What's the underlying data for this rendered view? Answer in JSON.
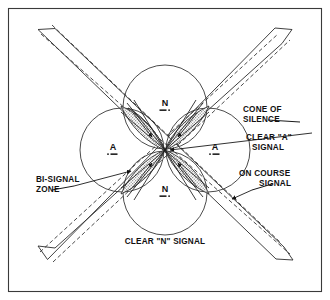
{
  "figure": {
    "frame_color": "#3a3a3a",
    "line_color": "#2b2b2b",
    "shade_color": "#8c8c8c",
    "background": "#ffffff"
  },
  "sectors": [
    {
      "id": "north",
      "letter": "N",
      "morse": "-.",
      "x": 165,
      "y": 106
    },
    {
      "id": "west",
      "letter": "A",
      "morse": ".-",
      "x": 113,
      "y": 150
    },
    {
      "id": "east",
      "letter": "A",
      "morse": ".-",
      "x": 215,
      "y": 150
    },
    {
      "id": "south",
      "letter": "N",
      "morse": "-.",
      "x": 165,
      "y": 192
    }
  ],
  "labels": {
    "cone_of_silence": {
      "line1": "CONE OF",
      "line2": "SILENCE"
    },
    "clear_a_signal": {
      "line1": "CLEAR \"A\"",
      "line2": "SIGNAL"
    },
    "bi_signal_zone": {
      "line1": "BI-SIGNAL",
      "line2": "ZONE"
    },
    "on_course_signal": {
      "line1": "ON COURSE",
      "line2": "SIGNAL"
    },
    "clear_n_signal": {
      "line1": "CLEAR \"N\" SIGNAL"
    }
  }
}
